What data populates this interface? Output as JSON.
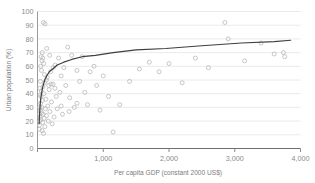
{
  "chart_data": {
    "type": "scatter",
    "title": "",
    "xlabel": "Per capita GDP (constant 2000 US$)",
    "ylabel": "Urban population (%)",
    "xlim": [
      0,
      4000
    ],
    "ylim": [
      0,
      100
    ],
    "xticks": [
      0,
      1000,
      2000,
      3000,
      4000
    ],
    "xtick_labels": [
      "",
      "1,000",
      "2,000",
      "3,000",
      "4,000"
    ],
    "yticks": [
      0,
      10,
      20,
      30,
      40,
      50,
      60,
      70,
      80,
      90,
      100
    ],
    "ytick_labels": [
      "0",
      "10",
      "20",
      "30",
      "40",
      "50",
      "60",
      "70",
      "80",
      "90",
      "100"
    ],
    "grid": "horizontal",
    "grid_color": "#e8e8e8",
    "axis_color": "#9a9a9a",
    "marker_color": "#b9b9b9",
    "marker_size": 2.0,
    "curve_color": "#3f3f3f",
    "curve_width": 1.2,
    "legend": "none",
    "series": [
      {
        "name": "Countries",
        "type": "scatter",
        "points": [
          [
            30,
            17
          ],
          [
            38,
            23
          ],
          [
            42,
            28
          ],
          [
            46,
            33
          ],
          [
            50,
            21
          ],
          [
            54,
            38
          ],
          [
            58,
            42
          ],
          [
            62,
            26
          ],
          [
            66,
            30
          ],
          [
            70,
            13
          ],
          [
            74,
            35
          ],
          [
            78,
            19
          ],
          [
            82,
            45
          ],
          [
            86,
            25
          ],
          [
            92,
            11
          ],
          [
            96,
            40
          ],
          [
            100,
            22
          ],
          [
            108,
            48
          ],
          [
            112,
            16
          ],
          [
            120,
            29
          ],
          [
            128,
            36
          ],
          [
            136,
            24
          ],
          [
            148,
            52
          ],
          [
            156,
            31
          ],
          [
            164,
            20
          ],
          [
            176,
            43
          ],
          [
            188,
            27
          ],
          [
            200,
            56
          ],
          [
            212,
            34
          ],
          [
            224,
            18
          ],
          [
            236,
            47
          ],
          [
            252,
            23
          ],
          [
            268,
            61
          ],
          [
            284,
            38
          ],
          [
            300,
            29
          ],
          [
            320,
            66
          ],
          [
            340,
            41
          ],
          [
            360,
            53
          ],
          [
            380,
            25
          ],
          [
            400,
            59
          ],
          [
            430,
            46
          ],
          [
            460,
            74
          ],
          [
            490,
            37
          ],
          [
            520,
            68
          ],
          [
            560,
            30
          ],
          [
            600,
            57
          ],
          [
            640,
            49
          ],
          [
            680,
            67
          ],
          [
            720,
            41
          ],
          [
            760,
            32
          ],
          [
            800,
            56
          ],
          [
            860,
            60
          ],
          [
            900,
            46
          ],
          [
            950,
            28
          ],
          [
            1000,
            53
          ],
          [
            1080,
            38
          ],
          [
            1150,
            12
          ],
          [
            1250,
            32
          ],
          [
            1400,
            49
          ],
          [
            1550,
            58
          ],
          [
            1700,
            63
          ],
          [
            1850,
            56
          ],
          [
            2000,
            62
          ],
          [
            2200,
            48
          ],
          [
            2400,
            66
          ],
          [
            2600,
            59
          ],
          [
            2850,
            92
          ],
          [
            2900,
            80
          ],
          [
            3150,
            64
          ],
          [
            3400,
            77
          ],
          [
            3600,
            69
          ],
          [
            3740,
            70
          ],
          [
            3760,
            67
          ],
          [
            55,
            67
          ],
          [
            68,
            64
          ],
          [
            140,
            73
          ],
          [
            185,
            68
          ],
          [
            240,
            59
          ],
          [
            105,
            54
          ],
          [
            135,
            50
          ],
          [
            170,
            46
          ],
          [
            95,
            62
          ],
          [
            60,
            57
          ],
          [
            44,
            49
          ],
          [
            36,
            44
          ],
          [
            48,
            60
          ],
          [
            40,
            39
          ],
          [
            34,
            30
          ],
          [
            33,
            25
          ],
          [
            31,
            20
          ],
          [
            29,
            14
          ],
          [
            90,
            92
          ],
          [
            115,
            91
          ],
          [
            205,
            47
          ],
          [
            265,
            44
          ],
          [
            360,
            31
          ],
          [
            480,
            27
          ],
          [
            600,
            33
          ],
          [
            72,
            70
          ],
          [
            80,
            66
          ]
        ]
      },
      {
        "name": "Logarithmic fit",
        "type": "line",
        "description": "Fitted log curve rising steeply near origin then flattening",
        "points": [
          [
            25,
            18
          ],
          [
            30,
            24
          ],
          [
            36,
            29
          ],
          [
            44,
            34
          ],
          [
            54,
            38
          ],
          [
            68,
            42
          ],
          [
            86,
            46
          ],
          [
            110,
            50
          ],
          [
            140,
            53
          ],
          [
            180,
            56
          ],
          [
            230,
            58
          ],
          [
            300,
            61
          ],
          [
            400,
            63
          ],
          [
            520,
            65
          ],
          [
            680,
            67
          ],
          [
            880,
            68
          ],
          [
            1150,
            70
          ],
          [
            1500,
            72
          ],
          [
            1950,
            73
          ],
          [
            2500,
            75
          ],
          [
            3100,
            77
          ],
          [
            3600,
            78
          ],
          [
            3850,
            79
          ]
        ]
      }
    ]
  },
  "axes": {
    "x_title": "Per capita GDP (constant 2000 US$)",
    "y_title": "Urban population (%)"
  }
}
